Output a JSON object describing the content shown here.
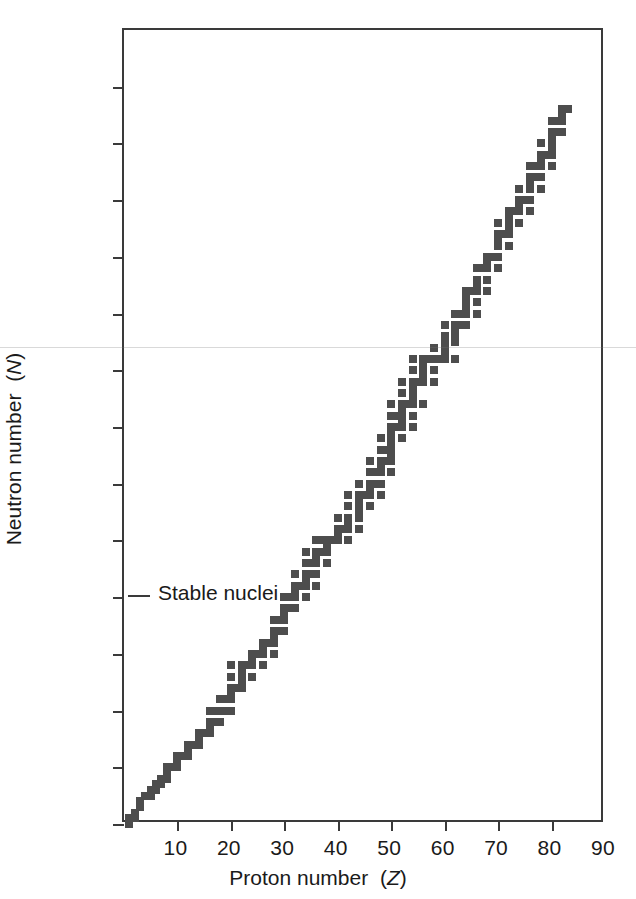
{
  "chart_data": {
    "type": "scatter",
    "title": "",
    "xlabel": "Proton number (Z)",
    "ylabel": "Neutron number (N)",
    "xlabel_plain": "Proton number",
    "xlabel_symbol": "Z",
    "ylabel_plain": "Neutron number",
    "ylabel_symbol": "N",
    "xlim": [
      0,
      90
    ],
    "ylim": [
      0,
      140
    ],
    "xticks": [
      0,
      10,
      20,
      30,
      40,
      50,
      60,
      70,
      80,
      90
    ],
    "xtick_labels": [
      "",
      "10",
      "20",
      "30",
      "40",
      "50",
      "60",
      "70",
      "80",
      "90"
    ],
    "yticks": [
      0,
      10,
      20,
      30,
      40,
      50,
      60,
      70,
      80,
      90,
      100,
      110,
      120,
      130,
      140
    ],
    "ytick_labels": [
      "0",
      "10",
      "20",
      "30",
      "40",
      "50",
      "60",
      "70",
      "80",
      "90",
      "100",
      "110",
      "120",
      "130",
      "140"
    ],
    "grid": false,
    "legend": null,
    "marker": "square",
    "marker_color": "#4d4d4d",
    "marker_size_px": 8,
    "annotations": [
      {
        "text": "Stable nuclei",
        "x": 3,
        "y": 40,
        "name": "stable-nuclei-label"
      }
    ],
    "series_name": "Stable nuclei",
    "point_count": 279,
    "points": [
      [
        1,
        0
      ],
      [
        1,
        1
      ],
      [
        2,
        1
      ],
      [
        2,
        2
      ],
      [
        3,
        3
      ],
      [
        3,
        4
      ],
      [
        4,
        5
      ],
      [
        5,
        5
      ],
      [
        5,
        6
      ],
      [
        6,
        6
      ],
      [
        6,
        7
      ],
      [
        7,
        7
      ],
      [
        7,
        8
      ],
      [
        8,
        8
      ],
      [
        8,
        9
      ],
      [
        8,
        10
      ],
      [
        9,
        10
      ],
      [
        10,
        10
      ],
      [
        10,
        11
      ],
      [
        10,
        12
      ],
      [
        11,
        12
      ],
      [
        12,
        12
      ],
      [
        12,
        13
      ],
      [
        12,
        14
      ],
      [
        13,
        14
      ],
      [
        14,
        14
      ],
      [
        14,
        15
      ],
      [
        14,
        16
      ],
      [
        15,
        16
      ],
      [
        16,
        16
      ],
      [
        16,
        17
      ],
      [
        16,
        18
      ],
      [
        16,
        20
      ],
      [
        17,
        18
      ],
      [
        17,
        20
      ],
      [
        18,
        18
      ],
      [
        18,
        20
      ],
      [
        18,
        22
      ],
      [
        19,
        20
      ],
      [
        19,
        22
      ],
      [
        20,
        20
      ],
      [
        20,
        22
      ],
      [
        20,
        23
      ],
      [
        20,
        24
      ],
      [
        20,
        26
      ],
      [
        20,
        28
      ],
      [
        21,
        24
      ],
      [
        22,
        24
      ],
      [
        22,
        25
      ],
      [
        22,
        26
      ],
      [
        22,
        27
      ],
      [
        22,
        28
      ],
      [
        23,
        28
      ],
      [
        24,
        26
      ],
      [
        24,
        28
      ],
      [
        24,
        29
      ],
      [
        24,
        30
      ],
      [
        25,
        30
      ],
      [
        26,
        28
      ],
      [
        26,
        30
      ],
      [
        26,
        31
      ],
      [
        26,
        32
      ],
      [
        27,
        32
      ],
      [
        28,
        30
      ],
      [
        28,
        32
      ],
      [
        28,
        33
      ],
      [
        28,
        34
      ],
      [
        28,
        36
      ],
      [
        29,
        34
      ],
      [
        29,
        36
      ],
      [
        30,
        34
      ],
      [
        30,
        36
      ],
      [
        30,
        37
      ],
      [
        30,
        38
      ],
      [
        30,
        40
      ],
      [
        31,
        38
      ],
      [
        31,
        40
      ],
      [
        32,
        38
      ],
      [
        32,
        40
      ],
      [
        32,
        41
      ],
      [
        32,
        42
      ],
      [
        32,
        44
      ],
      [
        33,
        42
      ],
      [
        34,
        40
      ],
      [
        34,
        42
      ],
      [
        34,
        43
      ],
      [
        34,
        44
      ],
      [
        34,
        46
      ],
      [
        34,
        48
      ],
      [
        35,
        44
      ],
      [
        35,
        46
      ],
      [
        36,
        42
      ],
      [
        36,
        44
      ],
      [
        36,
        46
      ],
      [
        36,
        47
      ],
      [
        36,
        48
      ],
      [
        36,
        50
      ],
      [
        37,
        48
      ],
      [
        37,
        50
      ],
      [
        38,
        46
      ],
      [
        38,
        48
      ],
      [
        38,
        49
      ],
      [
        38,
        50
      ],
      [
        39,
        50
      ],
      [
        40,
        50
      ],
      [
        40,
        51
      ],
      [
        40,
        52
      ],
      [
        40,
        54
      ],
      [
        41,
        52
      ],
      [
        42,
        50
      ],
      [
        42,
        52
      ],
      [
        42,
        53
      ],
      [
        42,
        54
      ],
      [
        42,
        56
      ],
      [
        42,
        58
      ],
      [
        44,
        52
      ],
      [
        44,
        54
      ],
      [
        44,
        55
      ],
      [
        44,
        56
      ],
      [
        44,
        57
      ],
      [
        44,
        58
      ],
      [
        44,
        60
      ],
      [
        45,
        58
      ],
      [
        46,
        56
      ],
      [
        46,
        58
      ],
      [
        46,
        59
      ],
      [
        46,
        60
      ],
      [
        46,
        62
      ],
      [
        46,
        64
      ],
      [
        47,
        60
      ],
      [
        47,
        62
      ],
      [
        48,
        58
      ],
      [
        48,
        60
      ],
      [
        48,
        62
      ],
      [
        48,
        63
      ],
      [
        48,
        64
      ],
      [
        48,
        66
      ],
      [
        48,
        68
      ],
      [
        49,
        64
      ],
      [
        49,
        66
      ],
      [
        50,
        62
      ],
      [
        50,
        64
      ],
      [
        50,
        65
      ],
      [
        50,
        66
      ],
      [
        50,
        67
      ],
      [
        50,
        68
      ],
      [
        50,
        69
      ],
      [
        50,
        70
      ],
      [
        50,
        72
      ],
      [
        50,
        74
      ],
      [
        51,
        70
      ],
      [
        51,
        72
      ],
      [
        52,
        68
      ],
      [
        52,
        70
      ],
      [
        52,
        71
      ],
      [
        52,
        72
      ],
      [
        52,
        73
      ],
      [
        52,
        74
      ],
      [
        52,
        76
      ],
      [
        52,
        78
      ],
      [
        53,
        74
      ],
      [
        54,
        70
      ],
      [
        54,
        72
      ],
      [
        54,
        74
      ],
      [
        54,
        75
      ],
      [
        54,
        76
      ],
      [
        54,
        77
      ],
      [
        54,
        78
      ],
      [
        54,
        80
      ],
      [
        54,
        82
      ],
      [
        55,
        78
      ],
      [
        56,
        74
      ],
      [
        56,
        78
      ],
      [
        56,
        79
      ],
      [
        56,
        80
      ],
      [
        56,
        81
      ],
      [
        56,
        82
      ],
      [
        57,
        82
      ],
      [
        58,
        78
      ],
      [
        58,
        80
      ],
      [
        58,
        82
      ],
      [
        58,
        84
      ],
      [
        59,
        82
      ],
      [
        60,
        82
      ],
      [
        60,
        83
      ],
      [
        60,
        84
      ],
      [
        60,
        85
      ],
      [
        60,
        86
      ],
      [
        60,
        88
      ],
      [
        62,
        82
      ],
      [
        62,
        85
      ],
      [
        62,
        86
      ],
      [
        62,
        87
      ],
      [
        62,
        88
      ],
      [
        62,
        90
      ],
      [
        63,
        88
      ],
      [
        63,
        90
      ],
      [
        64,
        88
      ],
      [
        64,
        90
      ],
      [
        64,
        91
      ],
      [
        64,
        92
      ],
      [
        64,
        93
      ],
      [
        64,
        94
      ],
      [
        65,
        94
      ],
      [
        66,
        90
      ],
      [
        66,
        92
      ],
      [
        66,
        94
      ],
      [
        66,
        95
      ],
      [
        66,
        96
      ],
      [
        66,
        98
      ],
      [
        67,
        98
      ],
      [
        68,
        94
      ],
      [
        68,
        96
      ],
      [
        68,
        98
      ],
      [
        68,
        99
      ],
      [
        68,
        100
      ],
      [
        69,
        100
      ],
      [
        70,
        98
      ],
      [
        70,
        100
      ],
      [
        70,
        102
      ],
      [
        70,
        103
      ],
      [
        70,
        104
      ],
      [
        70,
        106
      ],
      [
        71,
        104
      ],
      [
        72,
        102
      ],
      [
        72,
        104
      ],
      [
        72,
        105
      ],
      [
        72,
        106
      ],
      [
        72,
        107
      ],
      [
        72,
        108
      ],
      [
        73,
        108
      ],
      [
        74,
        106
      ],
      [
        74,
        108
      ],
      [
        74,
        109
      ],
      [
        74,
        110
      ],
      [
        74,
        112
      ],
      [
        75,
        110
      ],
      [
        76,
        108
      ],
      [
        76,
        110
      ],
      [
        76,
        112
      ],
      [
        76,
        113
      ],
      [
        76,
        114
      ],
      [
        76,
        116
      ],
      [
        77,
        114
      ],
      [
        77,
        116
      ],
      [
        78,
        112
      ],
      [
        78,
        114
      ],
      [
        78,
        116
      ],
      [
        78,
        117
      ],
      [
        78,
        118
      ],
      [
        78,
        120
      ],
      [
        79,
        118
      ],
      [
        80,
        116
      ],
      [
        80,
        118
      ],
      [
        80,
        119
      ],
      [
        80,
        120
      ],
      [
        80,
        121
      ],
      [
        80,
        122
      ],
      [
        80,
        124
      ],
      [
        81,
        122
      ],
      [
        81,
        124
      ],
      [
        82,
        122
      ],
      [
        82,
        124
      ],
      [
        82,
        125
      ],
      [
        82,
        126
      ],
      [
        83,
        126
      ]
    ]
  },
  "figure": {
    "background": "#ffffff",
    "axis_color": "#3a3a3a",
    "data_color": "#4d4d4d"
  }
}
